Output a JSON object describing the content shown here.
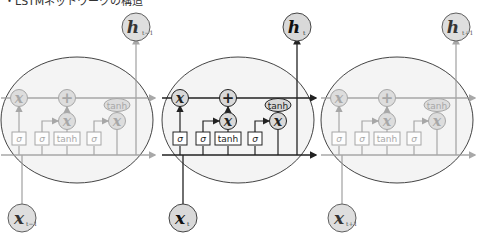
{
  "title": "・LSTMネットワークの構造",
  "cells": [
    {
      "id": "cell-prev",
      "cx": 77,
      "faded": true,
      "input": {
        "base": "x",
        "sub": "t−1"
      },
      "output": {
        "base": "h",
        "sub": "t−1"
      }
    },
    {
      "id": "cell-current",
      "cx": 238,
      "faded": false,
      "input": {
        "base": "x",
        "sub": "t"
      },
      "output": {
        "base": "h",
        "sub": "t"
      }
    },
    {
      "id": "cell-next",
      "cx": 397,
      "faded": true,
      "input": {
        "base": "x",
        "sub": "t+1"
      },
      "output": {
        "base": "h",
        "sub": "t+1"
      }
    }
  ],
  "gates": [
    "σ",
    "σ",
    "tanh",
    "σ"
  ],
  "ops": {
    "multiply": "x",
    "add": "+",
    "tanh": "tanh"
  },
  "colors": {
    "stroke": "#222222",
    "faded_stroke": "#9a9a9a",
    "node_fill": "#d9d9d9",
    "cell_fill": "#f4f4f4"
  }
}
